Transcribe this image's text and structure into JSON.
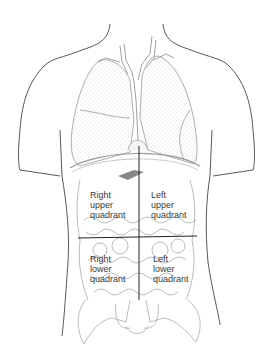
{
  "diagram": {
    "quadrants": [
      {
        "id": "ruq",
        "lines": [
          "Right",
          "upper",
          "quadrant"
        ]
      },
      {
        "id": "luq",
        "lines": [
          "Left",
          "upper",
          "quadrant"
        ]
      },
      {
        "id": "rlq",
        "lines": [
          "Right",
          "lower",
          "quadrant"
        ]
      },
      {
        "id": "llq",
        "lines": [
          "Left",
          "lower",
          "quadrant"
        ]
      }
    ],
    "colors": {
      "outline": "#333333",
      "organ": "#9a9a9a",
      "stipple": "#b8b8b8",
      "divider": "#222222"
    }
  }
}
